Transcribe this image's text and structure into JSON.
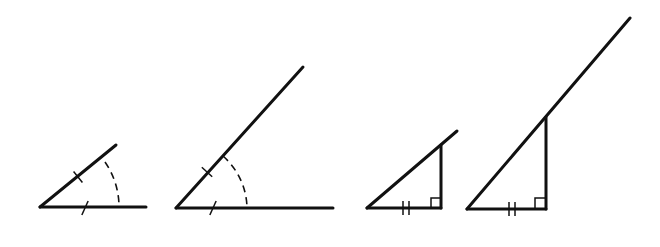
{
  "figures": [
    {
      "id": "angle-small",
      "kind": "angle-with-arc",
      "vertex": [
        40,
        207
      ],
      "ray_end": [
        116,
        145
      ],
      "base_end": [
        146,
        207
      ],
      "ray_tick": [
        78,
        177
      ],
      "base_tick": [
        85,
        208
      ],
      "arc_start": [
        105,
        162
      ],
      "arc_end": [
        119,
        207
      ],
      "arc_radius": 79
    },
    {
      "id": "angle-large",
      "kind": "angle-with-arc",
      "vertex": [
        176,
        208
      ],
      "ray_end": [
        303,
        67
      ],
      "base_end": [
        333,
        208
      ],
      "ray_tick": [
        207,
        172
      ],
      "base_tick": [
        213,
        208
      ],
      "arc_start": [
        223,
        156
      ],
      "arc_end": [
        247,
        208
      ],
      "arc_radius": 71
    },
    {
      "id": "right-triangle-small",
      "kind": "right-triangle-extended",
      "vertex": [
        367,
        208
      ],
      "ray_end": [
        457,
        131
      ],
      "right_corner": [
        441,
        208
      ],
      "top": [
        441,
        145
      ],
      "double_tick_x": [
        403,
        409
      ],
      "right_angle_size": 10
    },
    {
      "id": "right-triangle-large",
      "kind": "right-triangle-extended",
      "vertex": [
        467,
        209
      ],
      "ray_end": [
        630,
        18
      ],
      "right_corner": [
        546,
        209
      ],
      "top": [
        546,
        117
      ],
      "double_tick_x": [
        509,
        515
      ],
      "right_angle_size": 11
    }
  ],
  "colors": {
    "stroke": "#111111",
    "background": "#ffffff"
  }
}
